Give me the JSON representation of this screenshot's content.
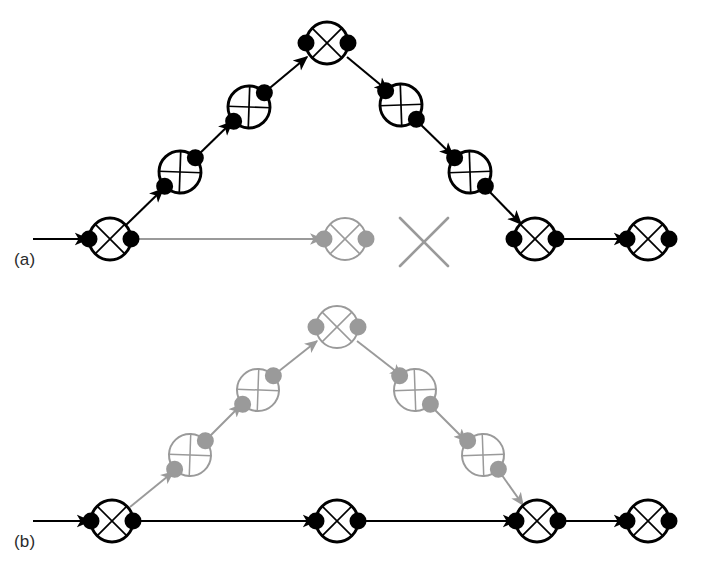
{
  "figure": {
    "type": "diagram",
    "background_color": "#ffffff",
    "colors": {
      "active": "#000000",
      "ghost": "#9a9a9a",
      "label": "#2b2b2b"
    },
    "node_radius": 21,
    "dot_radius": 8.5
  },
  "panels": [
    {
      "id": "a",
      "label": "(a)",
      "label_position": {
        "x": 14,
        "y": 250
      },
      "nodes": [
        {
          "name": "a-node-start",
          "x": 110,
          "y": 239,
          "angle": 0,
          "state": "active"
        },
        {
          "name": "a-node-up-1",
          "x": 180,
          "y": 172,
          "angle": -43,
          "state": "active"
        },
        {
          "name": "a-node-up-2",
          "x": 249,
          "y": 107,
          "angle": -43,
          "state": "active"
        },
        {
          "name": "a-node-peak",
          "x": 327,
          "y": 43,
          "angle": 0,
          "state": "active"
        },
        {
          "name": "a-node-down-1",
          "x": 401,
          "y": 105,
          "angle": 43,
          "state": "active"
        },
        {
          "name": "a-node-down-2",
          "x": 470,
          "y": 172,
          "angle": 43,
          "state": "active"
        },
        {
          "name": "a-node-join",
          "x": 535,
          "y": 239,
          "angle": 0,
          "state": "active"
        },
        {
          "name": "a-node-end",
          "x": 648,
          "y": 239,
          "angle": 0,
          "state": "active"
        },
        {
          "name": "a-node-ghost",
          "x": 345,
          "y": 239,
          "angle": 0,
          "state": "ghost"
        }
      ],
      "edges": [
        {
          "name": "a-edge-entry",
          "x1": 33,
          "y1": 239,
          "x2": 88,
          "y2": 239,
          "state": "active"
        },
        {
          "name": "a-edge-up-1",
          "x1": 126,
          "y1": 225,
          "x2": 163,
          "y2": 189,
          "state": "active"
        },
        {
          "name": "a-edge-up-2",
          "x1": 196,
          "y1": 157,
          "x2": 232,
          "y2": 122,
          "state": "active"
        },
        {
          "name": "a-edge-up-3",
          "x1": 265,
          "y1": 92,
          "x2": 307,
          "y2": 57,
          "state": "active"
        },
        {
          "name": "a-edge-down-1",
          "x1": 347,
          "y1": 57,
          "x2": 388,
          "y2": 91,
          "state": "active"
        },
        {
          "name": "a-edge-down-2",
          "x1": 417,
          "y1": 121,
          "x2": 453,
          "y2": 156,
          "state": "active"
        },
        {
          "name": "a-edge-down-3",
          "x1": 486,
          "y1": 188,
          "x2": 521,
          "y2": 224,
          "state": "active"
        },
        {
          "name": "a-edge-tail",
          "x1": 556,
          "y1": 239,
          "x2": 627,
          "y2": 239,
          "state": "active"
        },
        {
          "name": "a-edge-ghost",
          "x1": 131,
          "y1": 239,
          "x2": 322,
          "y2": 239,
          "state": "ghost"
        }
      ],
      "cross_marks": [
        {
          "name": "a-cross-blocked",
          "x": 424,
          "y": 242,
          "size": 48,
          "state": "ghost"
        }
      ]
    },
    {
      "id": "b",
      "label": "(b)",
      "label_position": {
        "x": 14,
        "y": 532
      },
      "nodes": [
        {
          "name": "b-node-start",
          "x": 112,
          "y": 521,
          "angle": 0,
          "state": "active"
        },
        {
          "name": "b-node-mid-1",
          "x": 337,
          "y": 521,
          "angle": 0,
          "state": "active"
        },
        {
          "name": "b-node-mid-2",
          "x": 537,
          "y": 521,
          "angle": 0,
          "state": "active"
        },
        {
          "name": "b-node-end",
          "x": 648,
          "y": 521,
          "angle": 0,
          "state": "active"
        },
        {
          "name": "b-node-up-1",
          "x": 190,
          "y": 455,
          "angle": -43,
          "state": "ghost"
        },
        {
          "name": "b-node-up-2",
          "x": 258,
          "y": 390,
          "angle": -43,
          "state": "ghost"
        },
        {
          "name": "b-node-peak",
          "x": 337,
          "y": 327,
          "angle": 0,
          "state": "ghost"
        },
        {
          "name": "b-node-down-1",
          "x": 415,
          "y": 390,
          "angle": 43,
          "state": "ghost"
        },
        {
          "name": "b-node-down-2",
          "x": 483,
          "y": 455,
          "angle": 43,
          "state": "ghost"
        }
      ],
      "edges": [
        {
          "name": "b-edge-entry",
          "x1": 33,
          "y1": 521,
          "x2": 90,
          "y2": 521,
          "state": "active"
        },
        {
          "name": "b-edge-base-1",
          "x1": 133,
          "y1": 521,
          "x2": 316,
          "y2": 521,
          "state": "active"
        },
        {
          "name": "b-edge-base-2",
          "x1": 358,
          "y1": 521,
          "x2": 516,
          "y2": 521,
          "state": "active"
        },
        {
          "name": "b-edge-base-3",
          "x1": 558,
          "y1": 521,
          "x2": 627,
          "y2": 521,
          "state": "active"
        },
        {
          "name": "b-edge-up-1",
          "x1": 130,
          "y1": 507,
          "x2": 173,
          "y2": 472,
          "state": "ghost"
        },
        {
          "name": "b-edge-up-2",
          "x1": 206,
          "y1": 440,
          "x2": 241,
          "y2": 405,
          "state": "ghost"
        },
        {
          "name": "b-edge-up-3",
          "x1": 274,
          "y1": 375,
          "x2": 317,
          "y2": 341,
          "state": "ghost"
        },
        {
          "name": "b-edge-down-1",
          "x1": 357,
          "y1": 341,
          "x2": 402,
          "y2": 376,
          "state": "ghost"
        },
        {
          "name": "b-edge-down-2",
          "x1": 431,
          "y1": 406,
          "x2": 466,
          "y2": 441,
          "state": "ghost"
        },
        {
          "name": "b-edge-down-3",
          "x1": 499,
          "y1": 471,
          "x2": 523,
          "y2": 505,
          "state": "ghost"
        }
      ],
      "cross_marks": []
    }
  ]
}
